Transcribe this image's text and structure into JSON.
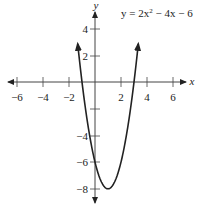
{
  "chart_data": {
    "type": "line",
    "title": "",
    "equation": "y = 2x² − 4x − 6",
    "xlabel": "x",
    "ylabel": "y",
    "xlim": [
      -7,
      7.2
    ],
    "ylim": [
      -9,
      5.5
    ],
    "x_ticks": [
      -6,
      -4,
      -2,
      2,
      4,
      6
    ],
    "x_tick_labels": [
      "−6",
      "−4",
      "−2",
      "2",
      "4",
      "6"
    ],
    "y_ticks": [
      4,
      2,
      -2,
      -4,
      -6,
      -8
    ],
    "y_tick_labels": [
      "4",
      "2",
      "",
      "−4",
      "−6",
      "−8"
    ],
    "grid": false,
    "legend": null,
    "series": [
      {
        "name": "y = 2x² − 4x − 6",
        "function": "2*x^2 - 4*x - 6",
        "x_range": [
          -1.33,
          3.33
        ],
        "roots": [
          -1,
          3
        ],
        "vertex": [
          1,
          -8
        ],
        "y_intercept": -6,
        "arrows_on_ends": true
      }
    ],
    "annotations": [
      {
        "text": "y = 2x² − 4x − 6",
        "position": "top-right"
      }
    ]
  },
  "labels": {
    "x_axis": "x",
    "y_axis": "y",
    "equation_prefix": "y = 2x",
    "equation_exp": "2",
    "equation_suffix": " − 4x − 6",
    "xt": [
      "−6",
      "−4",
      "−2",
      "2",
      "4",
      "6"
    ],
    "yt": [
      "4",
      "2",
      "−4",
      "−6",
      "−8"
    ]
  }
}
